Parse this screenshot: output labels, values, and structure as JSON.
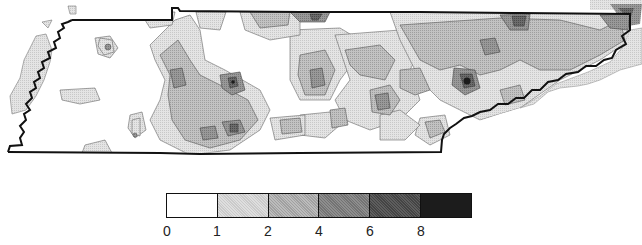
{
  "map": {
    "region": "Tennessee",
    "type": "contour density map",
    "border_color": "#111111"
  },
  "legend": {
    "classes": [
      {
        "from": "0",
        "to": "1",
        "color": "#ffffff"
      },
      {
        "from": "1",
        "to": "2",
        "color": "#d9d9d9"
      },
      {
        "from": "2",
        "to": "4",
        "color": "#b3b3b3"
      },
      {
        "from": "4",
        "to": "6",
        "color": "#8a8a8a"
      },
      {
        "from": "6",
        "to": "8",
        "color": "#5e5e5e"
      },
      {
        "from": "8",
        "to": "",
        "color": "#1c1c1c"
      }
    ],
    "ticks": [
      "0",
      "1",
      "2",
      "4",
      "6",
      "8"
    ]
  }
}
